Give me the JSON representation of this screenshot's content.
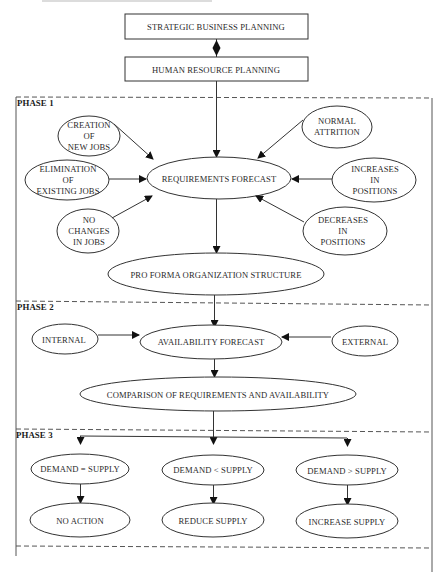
{
  "diagram": {
    "type": "flowchart",
    "colors": {
      "stroke": "#333333",
      "text": "#2a2a2a",
      "background": "#ffffff",
      "dashed_border": "#555555"
    },
    "top_boxes": [
      {
        "id": "strategic",
        "label": "STRATEGIC BUSINESS PLANNING"
      },
      {
        "id": "hrp",
        "label": "HUMAN RESOURCE PLANNING"
      }
    ],
    "phases": [
      {
        "label": "PHASE 1",
        "inputs": [
          {
            "id": "creation",
            "label": "CREATION\nOF\nNEW JOBS"
          },
          {
            "id": "elimination",
            "label": "ELIMINATION\nOF\nEXISTING JOBS"
          },
          {
            "id": "nochange",
            "label": "NO\nCHANGES\nIN JOBS"
          },
          {
            "id": "attrition",
            "label": "NORMAL\nATTRITION"
          },
          {
            "id": "increases",
            "label": "INCREASES\nIN\nPOSITIONS"
          },
          {
            "id": "decreases",
            "label": "DECREASES\nIN\nPOSITIONS"
          }
        ],
        "center": {
          "id": "requirements",
          "label": "REQUIREMENTS FORECAST"
        },
        "output": {
          "id": "proforma",
          "label": "PRO FORMA ORGANIZATION STRUCTURE"
        }
      },
      {
        "label": "PHASE 2",
        "inputs": [
          {
            "id": "internal",
            "label": "INTERNAL"
          },
          {
            "id": "external",
            "label": "EXTERNAL"
          }
        ],
        "center": {
          "id": "availability",
          "label": "AVAILABILITY FORECAST"
        },
        "output": {
          "id": "comparison",
          "label": "COMPARISON OF REQUIREMENTS AND AVAILABILITY"
        }
      },
      {
        "label": "PHASE 3",
        "conditions": [
          {
            "id": "equal",
            "label": "DEMAND = SUPPLY",
            "action": "NO ACTION"
          },
          {
            "id": "less",
            "label": "DEMAND < SUPPLY",
            "action": "REDUCE SUPPLY"
          },
          {
            "id": "greater",
            "label": "DEMAND > SUPPLY",
            "action": "INCREASE SUPPLY"
          }
        ]
      }
    ],
    "connectors": [
      {
        "from": "strategic",
        "to": "hrp",
        "style": "double-diamond"
      },
      {
        "from": "hrp",
        "to": "requirements",
        "style": "arrow"
      },
      {
        "from": "creation",
        "to": "requirements",
        "style": "arrow"
      },
      {
        "from": "elimination",
        "to": "requirements",
        "style": "arrow"
      },
      {
        "from": "nochange",
        "to": "requirements",
        "style": "arrow"
      },
      {
        "from": "attrition",
        "to": "requirements",
        "style": "arrow"
      },
      {
        "from": "increases",
        "to": "requirements",
        "style": "arrow"
      },
      {
        "from": "decreases",
        "to": "requirements",
        "style": "arrow"
      },
      {
        "from": "requirements",
        "to": "proforma",
        "style": "arrow"
      },
      {
        "from": "proforma",
        "to": "availability",
        "style": "arrow"
      },
      {
        "from": "internal",
        "to": "availability",
        "style": "arrow"
      },
      {
        "from": "external",
        "to": "availability",
        "style": "arrow"
      },
      {
        "from": "availability",
        "to": "comparison",
        "style": "arrow"
      },
      {
        "from": "comparison",
        "to": "equal",
        "style": "arrow"
      },
      {
        "from": "comparison",
        "to": "less",
        "style": "arrow"
      },
      {
        "from": "comparison",
        "to": "greater",
        "style": "arrow"
      },
      {
        "from": "equal",
        "to": "equal-action",
        "style": "arrow"
      },
      {
        "from": "less",
        "to": "less-action",
        "style": "arrow"
      },
      {
        "from": "greater",
        "to": "greater-action",
        "style": "arrow"
      }
    ]
  }
}
